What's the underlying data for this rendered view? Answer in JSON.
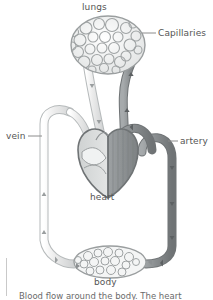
{
  "figure": {
    "type": "biology-diagram",
    "background_color": "#ffffff"
  },
  "labels": {
    "lungs": "lungs",
    "capillaries": "Capillaries",
    "vein": "vein",
    "artery": "artery",
    "heart": "heart",
    "body": "body"
  },
  "caption": {
    "text": "Blood flow around the body. The heart"
  },
  "colors": {
    "vein": "#d8dada",
    "vein_outline": "#a8acad",
    "artery": "#8e9294",
    "artery_outline": "#6f7375",
    "heart_left": "#d9dbdb",
    "heart_right": "#8f9395",
    "heart_outline": "#6f7375",
    "capillary_outline": "#9a9e9f",
    "label_text": "#555555",
    "leader_line": "#8c8c8c",
    "caption_text": "#6b6b6b",
    "caption_rule": "#c9c9c9"
  },
  "structures": [
    {
      "name": "lungs",
      "kind": "capillary-network"
    },
    {
      "name": "heart",
      "kind": "organ"
    },
    {
      "name": "body",
      "kind": "capillary-network"
    },
    {
      "name": "vein",
      "kind": "vessel",
      "side": "left",
      "flow": "toward-heart"
    },
    {
      "name": "artery",
      "kind": "vessel",
      "side": "right",
      "flow": "away-from-heart"
    }
  ]
}
